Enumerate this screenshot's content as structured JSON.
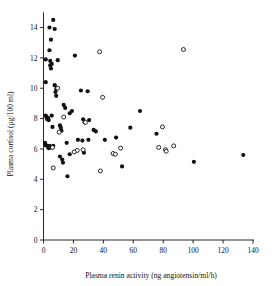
{
  "chart_data": {
    "type": "scatter",
    "title": "",
    "xlabel": "Plasma renin activity (ng angiotensin/ml/h)",
    "ylabel": "Plasma cortisol (µg/100 ml)",
    "xlim": [
      0,
      140
    ],
    "ylim": [
      0,
      15
    ],
    "xticks": [
      0,
      20,
      40,
      60,
      80,
      100,
      120,
      140
    ],
    "yticks": [
      0,
      2,
      4,
      6,
      8,
      10,
      12,
      14
    ],
    "xtick_labels": [
      "0",
      "20",
      "40",
      "60",
      "80",
      "100",
      "120",
      "140"
    ],
    "ytick_labels": [
      "0",
      "2",
      "4",
      "6",
      "8",
      "10",
      "12",
      "14"
    ],
    "grid": false,
    "legend": null,
    "series": [
      {
        "name": "filled",
        "marker": "filled-circle",
        "color": "#111111",
        "points": [
          [
            6.5,
            14.5
          ],
          [
            4.0,
            14.0
          ],
          [
            7.5,
            13.9
          ],
          [
            5.0,
            13.2
          ],
          [
            4.0,
            12.5
          ],
          [
            1.5,
            11.9
          ],
          [
            9.5,
            11.85
          ],
          [
            4.5,
            11.8
          ],
          [
            5.5,
            11.6
          ],
          [
            4.5,
            11.5
          ],
          [
            5.0,
            11.3
          ],
          [
            21.0,
            12.15
          ],
          [
            1.5,
            10.4
          ],
          [
            7.5,
            10.2
          ],
          [
            8.5,
            9.95
          ],
          [
            8.0,
            9.75
          ],
          [
            8.5,
            9.5
          ],
          [
            25.0,
            9.85
          ],
          [
            29.5,
            9.8
          ],
          [
            13.5,
            8.9
          ],
          [
            14.5,
            8.7
          ],
          [
            19.0,
            8.5
          ],
          [
            17.5,
            8.35
          ],
          [
            1.5,
            8.2
          ],
          [
            2.0,
            8.1
          ],
          [
            3.0,
            8.05
          ],
          [
            2.5,
            7.95
          ],
          [
            3.5,
            7.9
          ],
          [
            5.5,
            8.2
          ],
          [
            64.5,
            8.5
          ],
          [
            6.0,
            7.45
          ],
          [
            11.0,
            7.55
          ],
          [
            11.5,
            7.4
          ],
          [
            12.0,
            7.2
          ],
          [
            26.5,
            7.95
          ],
          [
            30.5,
            7.9
          ],
          [
            27.5,
            7.75
          ],
          [
            33.5,
            7.25
          ],
          [
            35.0,
            7.15
          ],
          [
            58.0,
            7.4
          ],
          [
            75.5,
            7.0
          ],
          [
            1.0,
            6.4
          ],
          [
            1.5,
            6.25
          ],
          [
            2.5,
            6.2
          ],
          [
            3.0,
            6.15
          ],
          [
            4.0,
            6.2
          ],
          [
            5.0,
            6.1
          ],
          [
            3.5,
            6.05
          ],
          [
            6.5,
            6.2
          ],
          [
            15.5,
            6.4
          ],
          [
            23.0,
            6.6
          ],
          [
            26.0,
            6.55
          ],
          [
            30.0,
            6.6
          ],
          [
            41.0,
            6.6
          ],
          [
            48.5,
            6.75
          ],
          [
            11.0,
            5.5
          ],
          [
            12.5,
            5.3
          ],
          [
            13.0,
            5.1
          ],
          [
            17.5,
            5.65
          ],
          [
            27.0,
            5.75
          ],
          [
            16.0,
            4.2
          ],
          [
            52.5,
            4.85
          ],
          [
            100.5,
            5.15
          ],
          [
            133.5,
            5.6
          ]
        ]
      },
      {
        "name": "open",
        "marker": "open-circle",
        "color": "#ffffff",
        "points": [
          [
            37.5,
            12.4
          ],
          [
            93.5,
            12.55
          ],
          [
            9.5,
            10.0
          ],
          [
            39.5,
            9.4
          ],
          [
            13.5,
            8.1
          ],
          [
            28.0,
            7.75
          ],
          [
            10.5,
            7.1
          ],
          [
            6.0,
            6.1
          ],
          [
            51.5,
            6.05
          ],
          [
            77.0,
            6.1
          ],
          [
            81.5,
            5.95
          ],
          [
            82.0,
            5.85
          ],
          [
            87.0,
            6.2
          ],
          [
            79.5,
            7.45
          ],
          [
            22.5,
            5.9
          ],
          [
            26.5,
            5.95
          ],
          [
            20.5,
            5.8
          ],
          [
            46.5,
            5.7
          ],
          [
            48.0,
            5.65
          ],
          [
            6.5,
            4.75
          ],
          [
            38.0,
            4.55
          ]
        ]
      }
    ]
  }
}
